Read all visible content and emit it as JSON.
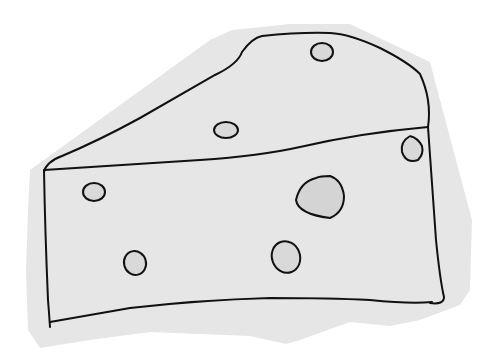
{
  "image": {
    "subject": "cheese wedge drawing",
    "style": "hand-drawn line sketch on grey paper cutout",
    "colors": {
      "background": "#ffffff",
      "paper": "#e6e6e6",
      "ink": "#111111",
      "shadow": "#d2d2d2"
    },
    "holes_count": 9
  }
}
